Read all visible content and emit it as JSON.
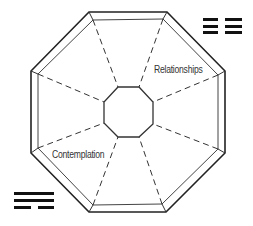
{
  "diagram": {
    "type": "bagua-octagon",
    "labels": {
      "northeast": "Relationships",
      "southwest": "Contemplation"
    },
    "colors": {
      "stroke": "#222222",
      "dashed": "#333333",
      "text": "#333333",
      "background": "#ffffff"
    },
    "trigrams": {
      "top_right": {
        "description": "two trigrams of three solid lines",
        "lines": [
          "solid",
          "solid",
          "solid"
        ]
      },
      "bottom_left": {
        "description": "trigram: solid, solid, broken",
        "lines": [
          "solid",
          "solid",
          "broken"
        ]
      }
    }
  }
}
